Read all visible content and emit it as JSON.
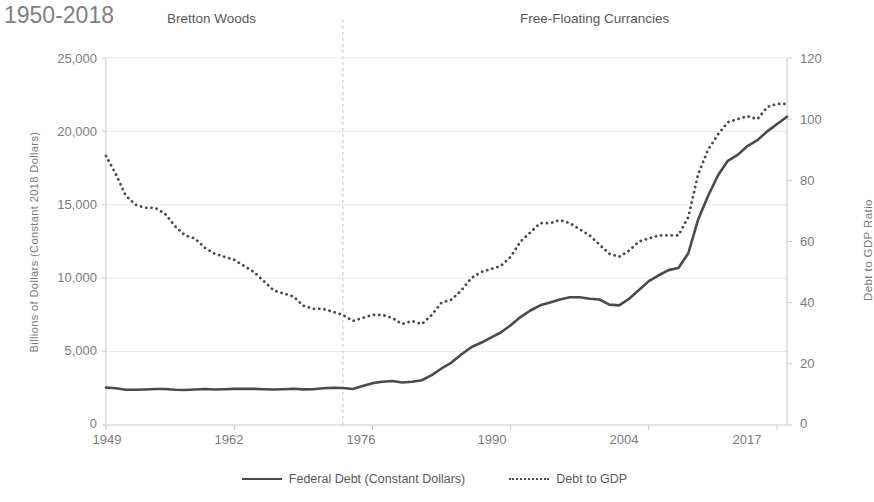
{
  "period_label": "1950-2018",
  "annotations": {
    "left": "Bretton Woods",
    "right": "Free-Floating Currancies"
  },
  "legend": {
    "series1": "Federal Debt (Constant Dollars)",
    "series2": "Debt to GDP"
  },
  "axes": {
    "left_title": "Billions of Dollars (Constant 2018 Dollars)",
    "right_title": "Debt to GDP Ratio",
    "left_ticks": [
      "25,000",
      "20,000",
      "15,000",
      "10,000",
      "5,000",
      "0"
    ],
    "right_ticks": [
      "120",
      "100",
      "80",
      "60",
      "40",
      "20",
      "0"
    ],
    "x_ticks": [
      "1949",
      "1962",
      "1976",
      "1990",
      "2004",
      "2017"
    ]
  },
  "colors": {
    "line": "#4a4a4a",
    "grid": "#e8e8e8",
    "axis": "#c9c9c9",
    "text": "#7b7b7b",
    "title": "#7f7f7f"
  },
  "chart_data": {
    "type": "line",
    "title": "1950-2018",
    "xlabel": "",
    "ylabel": "Billions of Dollars (Constant 2018 Dollars)",
    "y2label": "Debt to GDP Ratio",
    "xlim": [
      1949,
      2018
    ],
    "ylim": [
      0,
      25000
    ],
    "y2lim": [
      0,
      120
    ],
    "ytick_values": [
      0,
      5000,
      10000,
      15000,
      20000,
      25000
    ],
    "y2tick_values": [
      0,
      20,
      40,
      60,
      80,
      100,
      120
    ],
    "xtick_values": [
      1949,
      1962,
      1976,
      1990,
      2004,
      2017
    ],
    "grid": true,
    "legend_position": "bottom",
    "annotations": [
      {
        "text": "Bretton Woods",
        "x": 1962,
        "note": "era label left of divider"
      },
      {
        "text": "Free-Floating Currancies",
        "x": 1996,
        "note": "era label right of divider"
      },
      {
        "type": "vline",
        "x": 1973,
        "style": "dashed",
        "note": "end of Bretton Woods"
      }
    ],
    "x": [
      1949,
      1950,
      1951,
      1952,
      1953,
      1954,
      1955,
      1956,
      1957,
      1958,
      1959,
      1960,
      1961,
      1962,
      1963,
      1964,
      1965,
      1966,
      1967,
      1968,
      1969,
      1970,
      1971,
      1972,
      1973,
      1974,
      1975,
      1976,
      1977,
      1978,
      1979,
      1980,
      1981,
      1982,
      1983,
      1984,
      1985,
      1986,
      1987,
      1988,
      1989,
      1990,
      1991,
      1992,
      1993,
      1994,
      1995,
      1996,
      1997,
      1998,
      1999,
      2000,
      2001,
      2002,
      2003,
      2004,
      2005,
      2006,
      2007,
      2008,
      2009,
      2010,
      2011,
      2012,
      2013,
      2014,
      2015,
      2016,
      2017,
      2018
    ],
    "series": [
      {
        "name": "Federal Debt (Constant Dollars)",
        "axis": "left",
        "style": "solid",
        "units": "Billions of 2018 Dollars",
        "values": [
          2550,
          2500,
          2400,
          2400,
          2420,
          2450,
          2450,
          2400,
          2380,
          2420,
          2450,
          2420,
          2440,
          2460,
          2460,
          2460,
          2440,
          2420,
          2440,
          2470,
          2430,
          2440,
          2500,
          2540,
          2520,
          2450,
          2650,
          2850,
          2950,
          3000,
          2900,
          2950,
          3050,
          3400,
          3850,
          4250,
          4800,
          5300,
          5600,
          5950,
          6300,
          6800,
          7350,
          7800,
          8150,
          8350,
          8550,
          8700,
          8700,
          8600,
          8550,
          8200,
          8150,
          8600,
          9200,
          9800,
          10200,
          10550,
          10700,
          11700,
          14000,
          15600,
          17000,
          18000,
          18400,
          19000,
          19400,
          20000,
          20500,
          21000
        ]
      },
      {
        "name": "Debt to GDP",
        "axis": "right",
        "style": "dotted",
        "units": "Percent",
        "values": [
          88,
          82,
          75,
          72,
          71,
          71,
          69,
          65,
          62,
          61,
          58,
          56,
          55,
          54,
          52,
          50,
          47,
          44,
          43,
          42,
          39,
          38,
          38,
          37,
          36,
          34,
          35,
          36,
          36,
          35,
          33,
          34,
          33,
          36,
          40,
          41,
          44,
          48,
          50,
          51,
          52,
          55,
          60,
          63,
          66,
          66,
          67,
          66,
          64,
          62,
          59,
          56,
          55,
          57,
          60,
          61,
          62,
          62,
          62,
          68,
          82,
          90,
          95,
          99,
          100,
          101,
          100,
          104,
          105,
          105
        ]
      }
    ]
  }
}
